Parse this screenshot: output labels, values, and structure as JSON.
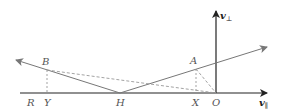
{
  "diagram": {
    "type": "vector-reflection-diagram",
    "axes": {
      "horizontal_label": "v",
      "horizontal_subscript": "∥",
      "vertical_label": "v",
      "vertical_subscript": "⊥"
    },
    "points": {
      "O": "O",
      "H": "H",
      "A": "A",
      "B": "B",
      "X": "X",
      "Y": "Y",
      "R": "R"
    },
    "colors": {
      "axis": "#222222",
      "line": "#777777",
      "dashed": "#999999",
      "label": "#555555"
    }
  }
}
